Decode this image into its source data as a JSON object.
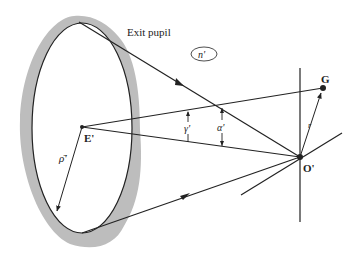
{
  "figure": {
    "type": "optical-geometry-diagram",
    "labels": {
      "exit_pupil": "Exit pupil",
      "medium_index": "n'",
      "pupil_center": "E'",
      "image_point": "O'",
      "object_point": "G",
      "pupil_radius": "ρ̄'",
      "gamma": "γ'",
      "alpha": "α'",
      "field_radius": "r"
    },
    "colors": {
      "line": "#222222",
      "pupil_shading": "#bdbdbd",
      "background": "#ffffff"
    },
    "points": {
      "E_prime": [
        82,
        127
      ],
      "O_prime": [
        300,
        157
      ],
      "G": [
        323,
        88
      ],
      "pupil_top": [
        79,
        22
      ],
      "pupil_bottom": [
        82,
        233
      ],
      "rho_end": [
        56,
        213
      ]
    },
    "pupil_ellipse": {
      "cx": 82,
      "cy": 128,
      "rx": 50,
      "ry": 105
    }
  }
}
